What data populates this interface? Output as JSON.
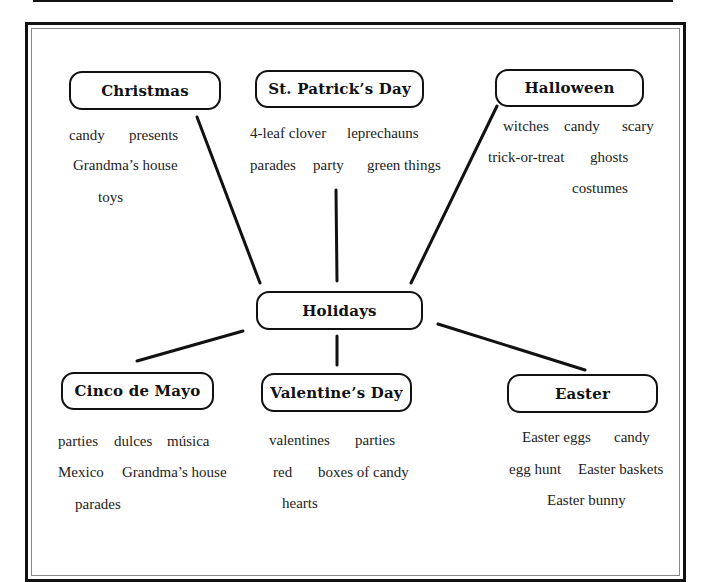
{
  "diagram": {
    "center": {
      "label": "Holidays"
    },
    "branches": [
      {
        "id": "christmas",
        "label": "Christmas",
        "words": [
          "candy",
          "presents",
          "Grandma’s house",
          "toys"
        ]
      },
      {
        "id": "st-patricks-day",
        "label": "St. Patrick’s Day",
        "words": [
          "4-leaf clover",
          "leprechauns",
          "parades",
          "party",
          "green things"
        ]
      },
      {
        "id": "halloween",
        "label": "Halloween",
        "words": [
          "witches",
          "candy",
          "scary",
          "trick-or-treat",
          "ghosts",
          "costumes"
        ]
      },
      {
        "id": "cinco-de-mayo",
        "label": "Cinco de Mayo",
        "words": [
          "parties",
          "dulces",
          "música",
          "Mexico",
          "Grandma’s house",
          "parades"
        ]
      },
      {
        "id": "valentines-day",
        "label": "Valentine’s Day",
        "words": [
          "valentines",
          "parties",
          "red",
          "boxes of candy",
          "hearts"
        ]
      },
      {
        "id": "easter",
        "label": "Easter",
        "words": [
          "Easter eggs",
          "candy",
          "egg hunt",
          "Easter baskets",
          "Easter bunny"
        ]
      }
    ],
    "colors": {
      "line": "#111111",
      "text": "#222222",
      "background": "#ffffff"
    }
  }
}
